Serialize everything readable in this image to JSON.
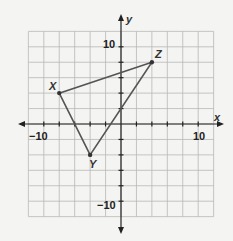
{
  "chart_data": {
    "type": "scatter",
    "title": "",
    "xlabel": "x",
    "ylabel": "y",
    "xlim": [
      -12,
      12
    ],
    "ylim": [
      -12,
      12
    ],
    "grid": true,
    "grid_step": 2,
    "x_tick_labels": [
      "-10",
      "10"
    ],
    "y_tick_labels": [
      "10",
      "-10"
    ],
    "points": [
      {
        "name": "X",
        "x": -8,
        "y": 4
      },
      {
        "name": "Y",
        "x": -4,
        "y": -4
      },
      {
        "name": "Z",
        "x": 4,
        "y": 8
      }
    ],
    "polygon": [
      "X",
      "Y",
      "Z"
    ],
    "line_color": "#555555"
  },
  "labels": {
    "x_axis": "x",
    "y_axis": "y",
    "x_neg10": "−10",
    "x_pos10": "10",
    "y_pos10": "10",
    "y_neg10": "−10",
    "point_x": "X",
    "point_y": "Y",
    "point_z": "Z"
  }
}
